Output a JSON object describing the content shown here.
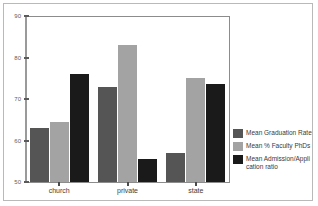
{
  "chart_data": {
    "type": "bar",
    "title": "",
    "subtitle": "",
    "xlabel": "",
    "ylabel": "",
    "categories": [
      "church",
      "private",
      "state"
    ],
    "series": [
      {
        "name": "Mean Graduation Rate",
        "color": "#555555",
        "values": [
          63,
          73,
          57
        ]
      },
      {
        "name": "Mean % Faculty PhDs",
        "color": "#a3a3a3",
        "values": [
          64.5,
          83,
          75
        ]
      },
      {
        "name": "Mean Admission/Appli\ncation ratio",
        "color": "#1a1a1a",
        "values": [
          76,
          55.5,
          73.5
        ]
      }
    ],
    "ylim": [
      50,
      90
    ],
    "yticks": [
      "50",
      "60",
      "70",
      "80",
      "90"
    ],
    "ytick_values": [
      50,
      60,
      70,
      80,
      90
    ],
    "grid": false,
    "legend_position": "right"
  },
  "legend": {
    "entries": [
      "Mean Graduation Rate",
      "Mean % Faculty PhDs",
      "Mean Admission/Appli\ncation ratio"
    ]
  },
  "axes": {
    "y_tick_labels": [
      "90",
      "80",
      "70",
      "60",
      "50"
    ],
    "x_tick_labels": [
      "church",
      "private",
      "state"
    ]
  },
  "colors": {
    "background": "#ffffff",
    "frame": "#b9b9b9",
    "plot_border": "#8c8c8c",
    "axis": "#9a9a9a",
    "series_1": "#555555",
    "series_2": "#a3a3a3",
    "series_3": "#1a1a1a",
    "tick_text": "#5e5e5e"
  }
}
